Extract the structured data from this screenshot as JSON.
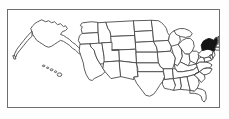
{
  "figure": {
    "kind": "map",
    "title": "United States map with one state highlighted",
    "frame_border_color": "#6e6e6e",
    "background_color": "#ffffff",
    "outline_color": "#4a4a4a",
    "highlight_color": "#141414",
    "highlighted_state": "New York",
    "highlighted_state_abbr": "NY",
    "projection_note": "Alaska and Hawaii shown as insets at lower left of the continental outline"
  },
  "map_data": {
    "type": "choropleth",
    "region": "United States of America",
    "states_shown": 50,
    "legend": [],
    "annotations": [],
    "states": [
      {
        "abbr": "AK",
        "name": "Alaska",
        "highlighted": false
      },
      {
        "abbr": "HI",
        "name": "Hawaii",
        "highlighted": false
      },
      {
        "abbr": "WA",
        "name": "Washington",
        "highlighted": false
      },
      {
        "abbr": "OR",
        "name": "Oregon",
        "highlighted": false
      },
      {
        "abbr": "CA",
        "name": "California",
        "highlighted": false
      },
      {
        "abbr": "NV",
        "name": "Nevada",
        "highlighted": false
      },
      {
        "abbr": "ID",
        "name": "Idaho",
        "highlighted": false
      },
      {
        "abbr": "MT",
        "name": "Montana",
        "highlighted": false
      },
      {
        "abbr": "WY",
        "name": "Wyoming",
        "highlighted": false
      },
      {
        "abbr": "UT",
        "name": "Utah",
        "highlighted": false
      },
      {
        "abbr": "AZ",
        "name": "Arizona",
        "highlighted": false
      },
      {
        "abbr": "CO",
        "name": "Colorado",
        "highlighted": false
      },
      {
        "abbr": "NM",
        "name": "New Mexico",
        "highlighted": false
      },
      {
        "abbr": "ND",
        "name": "North Dakota",
        "highlighted": false
      },
      {
        "abbr": "SD",
        "name": "South Dakota",
        "highlighted": false
      },
      {
        "abbr": "NE",
        "name": "Nebraska",
        "highlighted": false
      },
      {
        "abbr": "KS",
        "name": "Kansas",
        "highlighted": false
      },
      {
        "abbr": "OK",
        "name": "Oklahoma",
        "highlighted": false
      },
      {
        "abbr": "TX",
        "name": "Texas",
        "highlighted": false
      },
      {
        "abbr": "MN",
        "name": "Minnesota",
        "highlighted": false
      },
      {
        "abbr": "IA",
        "name": "Iowa",
        "highlighted": false
      },
      {
        "abbr": "MO",
        "name": "Missouri",
        "highlighted": false
      },
      {
        "abbr": "AR",
        "name": "Arkansas",
        "highlighted": false
      },
      {
        "abbr": "LA",
        "name": "Louisiana",
        "highlighted": false
      },
      {
        "abbr": "WI",
        "name": "Wisconsin",
        "highlighted": false
      },
      {
        "abbr": "IL",
        "name": "Illinois",
        "highlighted": false
      },
      {
        "abbr": "MI",
        "name": "Michigan",
        "highlighted": false
      },
      {
        "abbr": "IN",
        "name": "Indiana",
        "highlighted": false
      },
      {
        "abbr": "OH",
        "name": "Ohio",
        "highlighted": false
      },
      {
        "abbr": "KY",
        "name": "Kentucky",
        "highlighted": false
      },
      {
        "abbr": "TN",
        "name": "Tennessee",
        "highlighted": false
      },
      {
        "abbr": "MS",
        "name": "Mississippi",
        "highlighted": false
      },
      {
        "abbr": "AL",
        "name": "Alabama",
        "highlighted": false
      },
      {
        "abbr": "GA",
        "name": "Georgia",
        "highlighted": false
      },
      {
        "abbr": "FL",
        "name": "Florida",
        "highlighted": false
      },
      {
        "abbr": "SC",
        "name": "South Carolina",
        "highlighted": false
      },
      {
        "abbr": "NC",
        "name": "North Carolina",
        "highlighted": false
      },
      {
        "abbr": "VA",
        "name": "Virginia",
        "highlighted": false
      },
      {
        "abbr": "WV",
        "name": "West Virginia",
        "highlighted": false
      },
      {
        "abbr": "MD",
        "name": "Maryland",
        "highlighted": false
      },
      {
        "abbr": "DE",
        "name": "Delaware",
        "highlighted": false
      },
      {
        "abbr": "PA",
        "name": "Pennsylvania",
        "highlighted": false
      },
      {
        "abbr": "NJ",
        "name": "New Jersey",
        "highlighted": false
      },
      {
        "abbr": "NY",
        "name": "New York",
        "highlighted": true
      },
      {
        "abbr": "CT",
        "name": "Connecticut",
        "highlighted": false
      },
      {
        "abbr": "RI",
        "name": "Rhode Island",
        "highlighted": false
      },
      {
        "abbr": "MA",
        "name": "Massachusetts",
        "highlighted": false
      },
      {
        "abbr": "VT",
        "name": "Vermont",
        "highlighted": false
      },
      {
        "abbr": "NH",
        "name": "New Hampshire",
        "highlighted": false
      },
      {
        "abbr": "ME",
        "name": "Maine",
        "highlighted": false
      }
    ]
  }
}
